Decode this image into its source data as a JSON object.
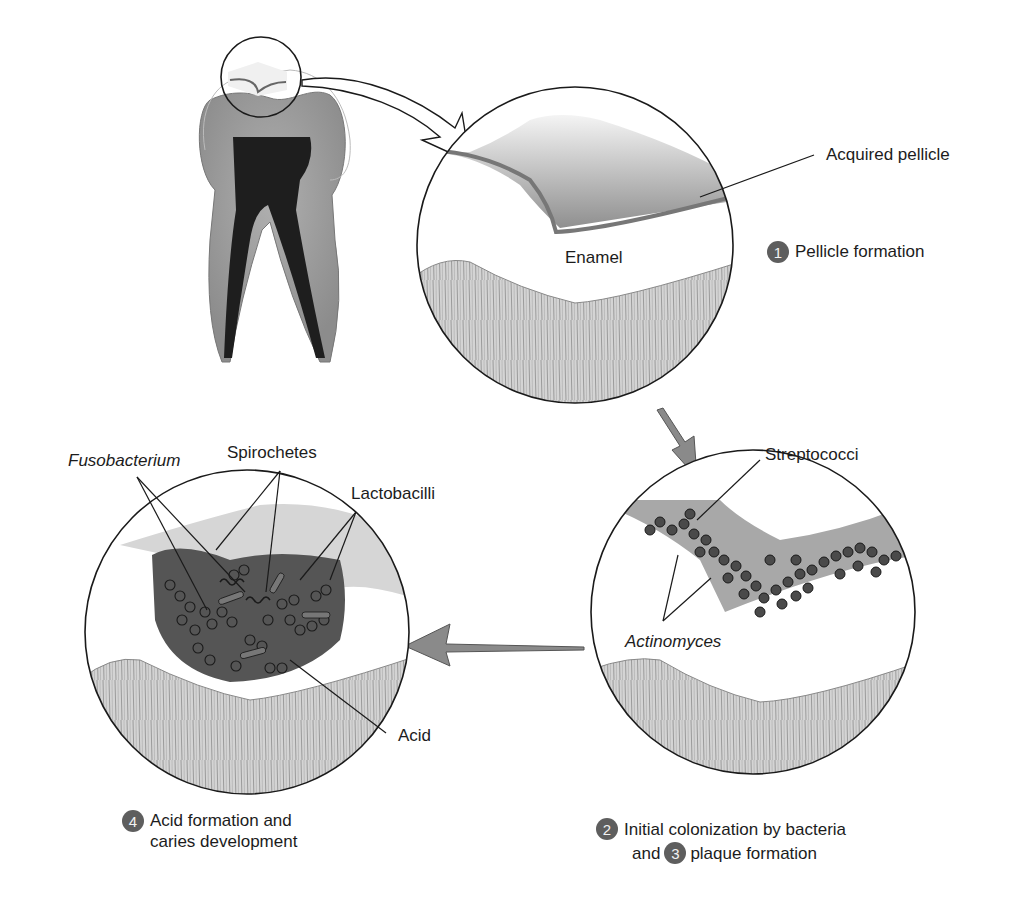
{
  "diagram": {
    "colors": {
      "badge": "#5e5e5e",
      "arrow_fill": "#8a8a8a",
      "enamel_texture": "#c9c9c9",
      "plaque": "#555555",
      "outline": "#1a1a1a"
    },
    "panels": [
      {
        "id": "tooth",
        "label": "Molar tooth cross-section"
      },
      {
        "id": "stage1",
        "labels": {
          "pellicle": "Acquired pellicle",
          "enamel": "Enamel"
        },
        "step": {
          "number": "1",
          "text": "Pellicle formation"
        }
      },
      {
        "id": "stage2_3",
        "labels": {
          "streptococci": "Streptococci",
          "actinomyces": "Actinomyces"
        },
        "step": {
          "number_a": "2",
          "text_a": "Initial colonization by bacteria",
          "and": "and",
          "number_b": "3",
          "text_b": "plaque formation"
        }
      },
      {
        "id": "stage4",
        "labels": {
          "fusobacterium": "Fusobacterium",
          "spirochetes": "Spirochetes",
          "lactobacilli": "Lactobacilli",
          "acid": "Acid"
        },
        "step": {
          "number": "4",
          "line1": "Acid formation and",
          "line2": "caries development"
        }
      }
    ],
    "flow": [
      "tooth",
      "stage1",
      "stage2_3",
      "stage4"
    ]
  }
}
